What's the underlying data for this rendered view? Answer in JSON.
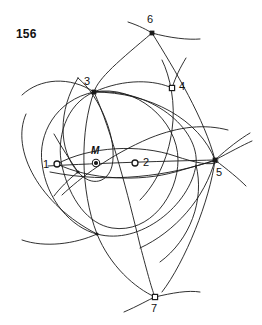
{
  "figure": {
    "number_label": "156",
    "number_pos": {
      "x": 16,
      "y": 27
    },
    "stroke_color": "#1a1a1a",
    "background_color": "#ffffff",
    "width": 262,
    "height": 325
  },
  "points": [
    {
      "id": "p1",
      "label": "1",
      "x": 57,
      "y": 164,
      "marker": "hollow-circle",
      "label_pos": {
        "x": 43,
        "y": 159
      }
    },
    {
      "id": "pM",
      "label": "M",
      "x": 96,
      "y": 163,
      "marker": "filled-ring",
      "label_pos": {
        "x": 91,
        "y": 146
      },
      "italic": true
    },
    {
      "id": "p2",
      "label": "2",
      "x": 135,
      "y": 163,
      "marker": "hollow-circle",
      "label_pos": {
        "x": 143,
        "y": 157
      }
    },
    {
      "id": "p3",
      "label": "3",
      "x": 94,
      "y": 92,
      "marker": "filled-square",
      "label_pos": {
        "x": 84,
        "y": 76
      }
    },
    {
      "id": "p4",
      "label": "4",
      "x": 172,
      "y": 88,
      "marker": "hollow-square",
      "label_pos": {
        "x": 179,
        "y": 81
      }
    },
    {
      "id": "p5",
      "label": "5",
      "x": 215,
      "y": 160,
      "marker": "filled-square",
      "label_pos": {
        "x": 216,
        "y": 167
      }
    },
    {
      "id": "p6",
      "label": "6",
      "x": 152,
      "y": 33,
      "marker": "filled-square",
      "label_pos": {
        "x": 147,
        "y": 14
      }
    },
    {
      "id": "p7",
      "label": "7",
      "x": 155,
      "y": 297,
      "marker": "hollow-square",
      "label_pos": {
        "x": 151,
        "y": 303
      }
    }
  ],
  "unlabeled_nodes": [
    {
      "id": "nA",
      "x": 97,
      "y": 234
    },
    {
      "id": "nB",
      "x": 78,
      "y": 172
    }
  ],
  "arcs": [
    {
      "id": "arc-left-upper",
      "d": "M 22,95 C 40,78 70,76 94,92"
    },
    {
      "id": "arc-left-big",
      "d": "M 26,114 C 10,150 40,205 97,234"
    },
    {
      "id": "arc-left-lower",
      "d": "M 22,240 C 45,248 75,244 97,234"
    },
    {
      "id": "arc-3-to-4-top",
      "d": "M 94,92 C 125,78 155,80 172,88"
    },
    {
      "id": "arc-3-right-long",
      "d": "M 94,92 C 150,92 200,120 215,160"
    },
    {
      "id": "arc-6-left-tail",
      "d": "M 128,22 C 140,26 147,30 152,33"
    },
    {
      "id": "arc-6-right-tail",
      "d": "M 152,33 C 170,38 188,40 200,39"
    },
    {
      "id": "arc-6-down-left",
      "d": "M 152,33 C 120,60 98,78 94,92"
    },
    {
      "id": "arc-6-down-right",
      "d": "M 152,33 C 175,70 205,120 215,160"
    },
    {
      "id": "arc-big-circle-outer",
      "d": "M 94,92 C 55,100 38,135 42,163 C 46,200 72,228 97,234 C 140,246 190,205 196,165 C 200,128 150,88 94,92 Z"
    },
    {
      "id": "arc-mid-circle",
      "d": "M 94,92 C 65,104 56,140 62,166 C 70,200 88,224 112,228 C 150,234 178,195 178,160 C 178,120 135,84 94,92 Z"
    },
    {
      "id": "arc-small-left",
      "d": "M 78,78 C 58,110 58,150 78,172 C 92,188 108,182 112,166 C 118,140 100,96 78,78 Z"
    },
    {
      "id": "arc-lens-1",
      "d": "M 57,164 C 90,146 140,144 175,156 C 196,163 210,166 218,162"
    },
    {
      "id": "arc-lens-2",
      "d": "M 57,164 C 90,180 140,182 175,172 C 196,166 210,162 218,160"
    },
    {
      "id": "arc-chord-1-5",
      "d": "M 48,166 C 100,163 170,161 215,160"
    },
    {
      "id": "arc-chord-low",
      "d": "M 50,172 C 110,184 170,176 215,160"
    },
    {
      "id": "arc-thru-M-up",
      "d": "M 62,195 C 80,178 110,155 150,138 C 180,126 205,124 228,130"
    },
    {
      "id": "arc-3-vert-left",
      "d": "M 94,92 C 80,130 80,190 97,234 C 110,266 135,288 155,297"
    },
    {
      "id": "arc-3-vert-right",
      "d": "M 94,92 C 112,132 128,195 140,245 C 148,275 152,290 155,297"
    },
    {
      "id": "arc-5-down-to-7",
      "d": "M 215,160 C 210,200 185,262 162,292"
    },
    {
      "id": "arc-5-low-sweep",
      "d": "M 215,160 C 205,198 175,232 140,248"
    },
    {
      "id": "arc-7-left-tail",
      "d": "M 124,312 C 138,306 148,300 155,297"
    },
    {
      "id": "arc-7-right-tail",
      "d": "M 155,297 C 172,293 188,290 200,292"
    },
    {
      "id": "arc-4-up-tail",
      "d": "M 172,88 C 176,76 180,68 186,58"
    },
    {
      "id": "arc-5-tail-ne1",
      "d": "M 215,160 C 228,148 240,139 250,133"
    },
    {
      "id": "arc-5-tail-ne2",
      "d": "M 215,160 C 230,152 243,145 252,141"
    },
    {
      "id": "arc-5-tail-se",
      "d": "M 215,160 C 228,170 238,178 246,186"
    },
    {
      "id": "arc-1-tail-sw",
      "d": "M 78,172 C 68,180 60,188 54,196"
    },
    {
      "id": "arc-1-tail-nw",
      "d": "M 78,172 C 70,160 62,148 54,134"
    },
    {
      "id": "arc-vert-thru-4",
      "d": "M 162,60 C 170,76 176,104 172,130 C 168,160 155,185 140,200"
    },
    {
      "id": "arc-outer-right",
      "d": "M 196,165 C 205,200 190,240 160,262"
    }
  ]
}
